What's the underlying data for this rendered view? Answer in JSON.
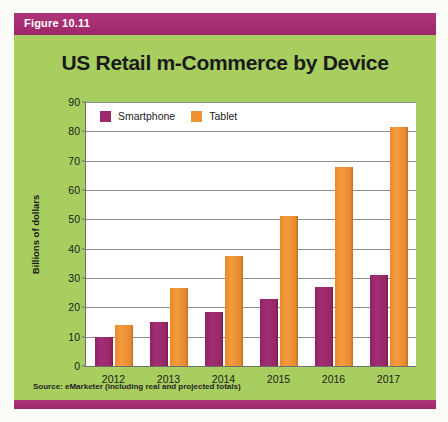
{
  "figure": {
    "caption_label": "Figure 10.11",
    "source_note": "Source: eMarketer (including real and projected totals)"
  },
  "colors": {
    "panel_background": "#a8ce60",
    "caption_bar": "#a42a6e",
    "smartphone": "#9c2a6f",
    "tablet": "#ef9234",
    "plot_background": "#ffffff",
    "gridline": "#8d8d8d"
  },
  "chart_data": {
    "type": "bar",
    "title": "US Retail m-Commerce by Device",
    "xlabel": "",
    "ylabel": "Billions of dollars",
    "categories": [
      "2012",
      "2013",
      "2014",
      "2015",
      "2016",
      "2017"
    ],
    "series": [
      {
        "name": "Smartphone",
        "color": "#9c2a6f",
        "values": [
          10,
          15,
          18.5,
          23,
          27,
          31
        ]
      },
      {
        "name": "Tablet",
        "color": "#ef9234",
        "values": [
          14,
          26.5,
          37.5,
          51,
          68,
          81.5
        ]
      }
    ],
    "ylim": [
      0,
      90
    ],
    "yticks": [
      0,
      10,
      20,
      30,
      40,
      50,
      60,
      70,
      80,
      90
    ],
    "ytick_labels": [
      "0",
      "10",
      "20",
      "30",
      "40",
      "50",
      "60",
      "70",
      "80",
      "90"
    ],
    "grid": true,
    "legend_position": "top-left-inside",
    "legend": [
      "Smartphone",
      "Tablet"
    ]
  }
}
